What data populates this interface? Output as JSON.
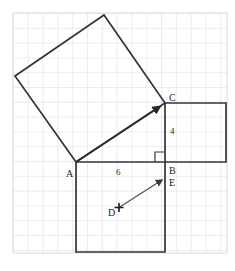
{
  "figure": {
    "background_color": "#ffffff",
    "grid": {
      "line_color": "#d9d9de",
      "cell_size": 14.8,
      "left": 13,
      "top": 13,
      "right": 227,
      "bottom": 253,
      "columns": 14,
      "rows": 16
    },
    "stroke_color": "#33333a",
    "vector_color": "#5a5a62",
    "points": {
      "A": {
        "x": 76,
        "y": 162
      },
      "B": {
        "x": 165,
        "y": 162
      },
      "C": {
        "x": 165,
        "y": 103
      },
      "D": {
        "x": 119,
        "y": 207
      },
      "E": {
        "x": 164,
        "y": 178
      }
    },
    "labels": {
      "A": "A",
      "B": "B",
      "C": "C",
      "D": "D",
      "E": "E",
      "side_ab": "6",
      "side_bc": "4"
    },
    "shapes": {
      "tilted_square": {
        "name": "square-on-hypotenuse",
        "vertices": "76,162 15,76 104,15 165,103"
      },
      "bottom_square": {
        "name": "square-on-side-ab",
        "vertices": "76,162 165,162 165,252 76,252"
      },
      "right_square": {
        "name": "square-on-side-bc",
        "vertices": "165,103 226,103 226,162 165,162"
      },
      "right_angle_marker": {
        "name": "right-angle-at-b",
        "vertices": "155,162 155,152 165,152"
      }
    },
    "vectors": {
      "ac": {
        "name": "vector-a-to-c",
        "x1": 76,
        "y1": 162,
        "x2": 165,
        "y2": 103
      },
      "de": {
        "name": "vector-d-to-e",
        "x1": 119,
        "y1": 207,
        "x2": 164,
        "y2": 178
      }
    }
  }
}
